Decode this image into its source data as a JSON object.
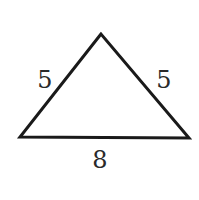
{
  "diagram": {
    "shape": "isosceles-triangle",
    "stroke_color": "#1a1a1a",
    "background": "#ffffff",
    "vertices": {
      "apex": [
        101,
        34
      ],
      "bottom_left": [
        20,
        137
      ],
      "bottom_right": [
        189,
        138
      ]
    },
    "sides": {
      "left": {
        "label": "5"
      },
      "right": {
        "label": "5"
      },
      "base": {
        "label": "8"
      }
    }
  }
}
